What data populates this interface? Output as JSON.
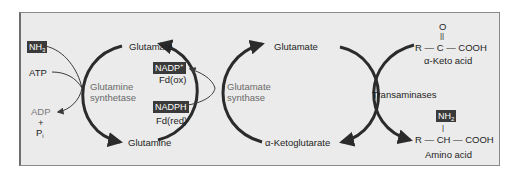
{
  "diagram": {
    "type": "biochemical-pathway",
    "left_cycle": {
      "inputs": [
        {
          "label": "NH",
          "sub": "3",
          "boxed": true
        },
        {
          "label": "ATP"
        }
      ],
      "outputs": [
        {
          "label": "ADP"
        },
        {
          "label": "+"
        },
        {
          "label": "P",
          "sub": "i"
        }
      ],
      "enzyme": {
        "line1": "Glutamine",
        "line2": "synthetase"
      },
      "top": "Glutamate",
      "bottom": "Glutamine"
    },
    "middle_cycle": {
      "cofactors": [
        {
          "label": "NADP",
          "sup": "+",
          "boxed": true,
          "sublabel": "Fd(ox)"
        },
        {
          "label": "NADPH",
          "boxed": true,
          "sublabel": "Fd(red)"
        }
      ],
      "enzyme": {
        "line1": "Glutamate",
        "line2": "synthase"
      },
      "top": "Glutamate",
      "bottom": "α-Ketoglutarate"
    },
    "right_cycle": {
      "enzyme": "Transaminases",
      "keto_acid": {
        "o": "O",
        "bond": "||",
        "formula": "R — C — COOH",
        "name": "α-Keto acid"
      },
      "amino_acid": {
        "group": "NH",
        "group_sub": "2",
        "bond": "|",
        "formula": "R — CH — COOH",
        "name": "Amino acid"
      }
    }
  },
  "colors": {
    "panel_bg": "#ebebeb",
    "arrow": "#2b2b2b",
    "enzyme_text": "#6a6a6a",
    "box_bg": "#3a3a3a"
  }
}
